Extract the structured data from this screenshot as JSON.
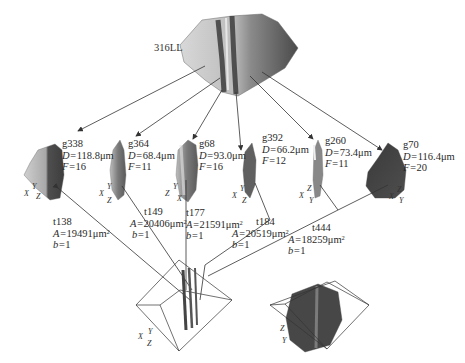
{
  "figure": {
    "parent": {
      "label": "316LL"
    },
    "grains": [
      {
        "id": "g338",
        "D_label": "D=",
        "D": "118.8μm",
        "F_label": "F=",
        "F": "16",
        "axes": [
          "Y",
          "X",
          "Z"
        ]
      },
      {
        "id": "g364",
        "D_label": "D=",
        "D": "68.4μm",
        "F_label": "F=",
        "F": "11",
        "axes": [
          "Y",
          "X",
          "Z"
        ]
      },
      {
        "id": "g68",
        "D_label": "D=",
        "D": "93.0μm",
        "F_label": "F=",
        "F": "16",
        "axes": [
          "Y",
          "Z",
          "X"
        ]
      },
      {
        "id": "g392",
        "D_label": "D=",
        "D": "66.2μm",
        "F_label": "F=",
        "F": "12",
        "axes": [
          "Y",
          "X",
          "Z"
        ]
      },
      {
        "id": "g260",
        "D_label": "D=",
        "D": "73.4μm",
        "F_label": "F=",
        "F": "11",
        "axes": [
          "Z",
          "X",
          "Y"
        ]
      },
      {
        "id": "g70",
        "D_label": "D=",
        "D": "116.4μm",
        "F_label": "F=",
        "F": "20",
        "axes": [
          "Z",
          "X",
          "Y"
        ]
      }
    ],
    "twins": [
      {
        "id": "t138",
        "A_label": "A=",
        "A": "19491μm",
        "b_label": "b=",
        "b": "1"
      },
      {
        "id": "t149",
        "A_label": "A=",
        "A": "20406μm",
        "b_label": "b=",
        "b": "1"
      },
      {
        "id": "t177",
        "A_label": "A=",
        "A": "21591μm",
        "b_label": "b=",
        "b": "1"
      },
      {
        "id": "t184",
        "A_label": "A=",
        "A": "20519μm",
        "b_label": "b=",
        "b": "1"
      },
      {
        "id": "t444",
        "A_label": "A=",
        "A": "18259μm",
        "b_label": "b=",
        "b": "1"
      }
    ],
    "area_exponent": "2",
    "twin_boxes": [
      {
        "name": "twin-box-left",
        "axes": [
          "Y",
          "X",
          "Z"
        ]
      },
      {
        "name": "twin-box-right",
        "axes": [
          "Z",
          "Y"
        ]
      }
    ]
  }
}
